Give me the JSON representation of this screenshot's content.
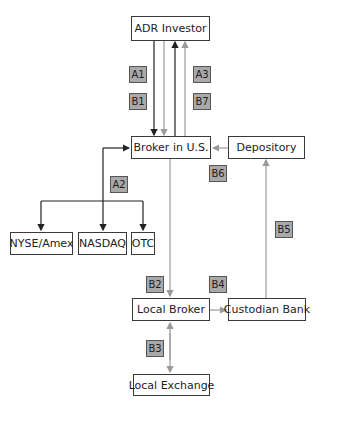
{
  "nodes": {
    "adr_investor": "ADR Investor",
    "broker_us": "Broker in U.S.",
    "depository": "Depository",
    "nyse_amex": "NYSE/Amex",
    "nasdaq": "NASDAQ",
    "otc": "OTC",
    "local_broker": "Local Broker",
    "custodian_bank": "Custodian Bank",
    "local_exchange": "Local Exchange"
  },
  "tags": {
    "a1": "A1",
    "b1": "B1",
    "a3": "A3",
    "b7": "B7",
    "a2": "A2",
    "b6": "B6",
    "b2": "B2",
    "b4": "B4",
    "b5": "B5",
    "b3": "B3"
  },
  "colors": {
    "flow_a": "#222222",
    "flow_b": "#9a9a9a",
    "tag_fill": "#a9a9a9"
  }
}
